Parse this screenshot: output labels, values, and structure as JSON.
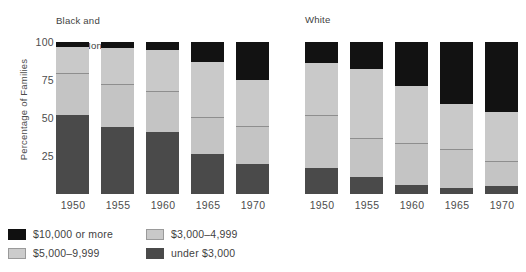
{
  "chart_data": {
    "type": "bar",
    "subtype": "stacked-percentage",
    "title": "",
    "xlabel": "",
    "ylabel": "Percentage of Families",
    "ylim": [
      0,
      100
    ],
    "yticks": [
      25,
      50,
      75,
      100
    ],
    "grid": false,
    "legend_position": "bottom-left",
    "categories": [
      "1950",
      "1955",
      "1960",
      "1965",
      "1970"
    ],
    "panels": [
      {
        "name": "Black and\nOther Nonwhite",
        "title_lines": [
          "Black and",
          "Other Nonwhite"
        ],
        "series": [
          {
            "name": "under $3,000",
            "color": "#4a4a4a",
            "values": [
              52,
              44,
              41,
              26,
              20
            ]
          },
          {
            "name": "$3,000–4,999",
            "color": "#c4c4c4",
            "values": [
              27,
              28,
              26,
              24,
              24
            ]
          },
          {
            "name": "$5,000–9,999",
            "color": "#c9c9c9",
            "values": [
              18,
              24,
              28,
              37,
              31
            ]
          },
          {
            "name": "$10,000 or more",
            "color": "#121212",
            "values": [
              3,
              4,
              5,
              13,
              25
            ]
          }
        ]
      },
      {
        "name": "White",
        "title_lines": [
          "White"
        ],
        "series": [
          {
            "name": "under $3,000",
            "color": "#4a4a4a",
            "values": [
              17,
              11,
              6,
              4,
              5
            ]
          },
          {
            "name": "$3,000–4,999",
            "color": "#c4c4c4",
            "values": [
              34,
              25,
              27,
              25,
              16
            ]
          },
          {
            "name": "$5,000–9,999",
            "color": "#c9c9c9",
            "values": [
              35,
              46,
              38,
              30,
              33
            ]
          },
          {
            "name": "$10,000 or more",
            "color": "#121212",
            "values": [
              14,
              18,
              29,
              41,
              46
            ]
          }
        ]
      }
    ]
  },
  "axis": {
    "y_title": "Percentage of Families",
    "y_ticks": [
      "100",
      "75",
      "50",
      "25"
    ],
    "x_ticks": [
      "1950",
      "1955",
      "1960",
      "1965",
      "1970"
    ]
  },
  "panel_titles": {
    "left_line1": "Black and",
    "left_line2": "Other Nonwhite",
    "right": "White"
  },
  "legend": {
    "items": [
      {
        "label": "$10,000 or more",
        "swatch": "black-swatch",
        "color": "#101010"
      },
      {
        "label": "$3,000–4,999",
        "swatch": "midgray-swatch",
        "color": "#c9c9c9"
      },
      {
        "label": "$5,000–9,999",
        "swatch": "lightgray-swatch",
        "color": "#cccccc"
      },
      {
        "label": "under $3,000",
        "swatch": "dark-swatch",
        "color": "#4a4a4a"
      }
    ]
  }
}
